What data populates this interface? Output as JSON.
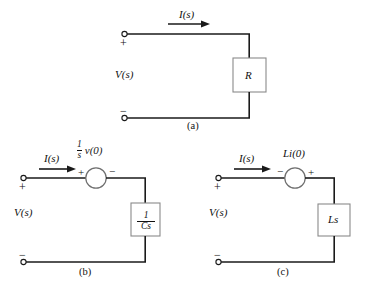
{
  "figure": {
    "title_alt": "Laplace-domain circuit element models",
    "background_color": "#ffffff",
    "line_color": "#1a1a1a",
    "text_color": "#111111"
  },
  "circuits": [
    {
      "id": "a",
      "caption": "(a)",
      "current_label": "I(s)",
      "voltage_label": "V(s)",
      "plus_sign": "+",
      "minus_sign": "−",
      "element_label": "R",
      "element_type": "resistor-box",
      "has_source": false
    },
    {
      "id": "b",
      "caption": "(b)",
      "current_label": "I(s)",
      "voltage_label": "V(s)",
      "plus_sign": "+",
      "minus_sign": "−",
      "element_type": "capacitor-box",
      "element_fraction": {
        "numerator": "1",
        "denominator": "Cs"
      },
      "has_source": true,
      "source_type": "voltage-source-circle",
      "source_fraction": {
        "numerator": "1",
        "denominator": "s"
      },
      "source_tail_label": "v(0)",
      "source_left_sign": "+",
      "source_right_sign": "−"
    },
    {
      "id": "c",
      "caption": "(c)",
      "current_label": "I(s)",
      "voltage_label": "V(s)",
      "plus_sign": "+",
      "minus_sign": "−",
      "element_type": "inductor-box",
      "element_label": "Ls",
      "has_source": true,
      "source_type": "voltage-source-circle",
      "source_label": "Li(0)",
      "source_left_sign": "−",
      "source_right_sign": "+"
    }
  ]
}
